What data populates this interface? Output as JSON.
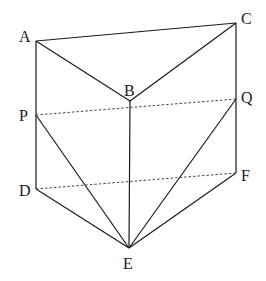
{
  "diagram": {
    "type": "triangular prism with cross-sections",
    "points": {
      "A": {
        "label": "A",
        "x": 36,
        "y": 41
      },
      "B": {
        "label": "B",
        "x": 130,
        "y": 101
      },
      "C": {
        "label": "C",
        "x": 236,
        "y": 23
      },
      "P": {
        "label": "P",
        "x": 36,
        "y": 115
      },
      "Q": {
        "label": "Q",
        "x": 236,
        "y": 99
      },
      "D": {
        "label": "D",
        "x": 36,
        "y": 189
      },
      "E": {
        "label": "E",
        "x": 129,
        "y": 248
      },
      "F": {
        "label": "F",
        "x": 236,
        "y": 173
      }
    },
    "solid_edges": [
      "AC",
      "AB",
      "BC",
      "AD",
      "BE",
      "CF",
      "DE",
      "EF",
      "PE",
      "QE"
    ],
    "dashed_edges": [
      "PQ",
      "DF"
    ],
    "colors": {
      "line": "#1a1a1a",
      "background": "#ffffff"
    }
  }
}
